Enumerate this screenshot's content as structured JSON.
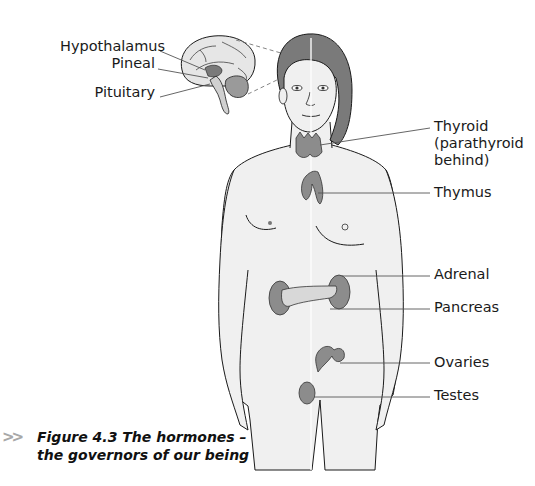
{
  "figure": {
    "caption_line1": "Figure 4.3 The hormones –",
    "caption_line2": "the governors of our being",
    "caption_marker": ">>",
    "colors": {
      "gland_fill": "#8c8c8c",
      "skin_fill": "#f0f0f0",
      "hair_fill": "#7a7a7a",
      "outline": "#1a1a1a",
      "leader_line": "#555555",
      "caption_marker": "#a8a8a8"
    },
    "labels_left": [
      {
        "id": "hypothalamus",
        "text": "Hypothalamus"
      },
      {
        "id": "pineal",
        "text": "Pineal"
      },
      {
        "id": "pituitary",
        "text": "Pituitary"
      }
    ],
    "labels_right": [
      {
        "id": "thyroid",
        "lines": [
          "Thyroid",
          "(parathyroid",
          "behind)"
        ]
      },
      {
        "id": "thymus",
        "text": "Thymus"
      },
      {
        "id": "adrenal",
        "text": "Adrenal"
      },
      {
        "id": "pancreas",
        "text": "Pancreas"
      },
      {
        "id": "ovaries",
        "text": "Ovaries"
      },
      {
        "id": "testes",
        "text": "Testes"
      }
    ]
  }
}
